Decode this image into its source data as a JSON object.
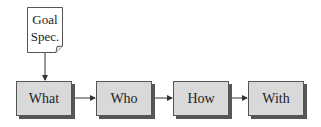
{
  "diagram": {
    "document": {
      "line1": "Goal",
      "line2": "Spec.",
      "icon": "document-icon"
    },
    "nodes": [
      {
        "id": "what",
        "label": "What"
      },
      {
        "id": "who",
        "label": "Who"
      },
      {
        "id": "how",
        "label": "How"
      },
      {
        "id": "with",
        "label": "With"
      }
    ],
    "edges": [
      {
        "from": "goal-spec",
        "to": "what"
      },
      {
        "from": "what",
        "to": "who"
      },
      {
        "from": "who",
        "to": "how"
      },
      {
        "from": "how",
        "to": "with"
      }
    ],
    "colors": {
      "box_fill": "#d9d9d9",
      "stroke": "#555555",
      "shadow": "#555555",
      "text": "#222222"
    }
  }
}
